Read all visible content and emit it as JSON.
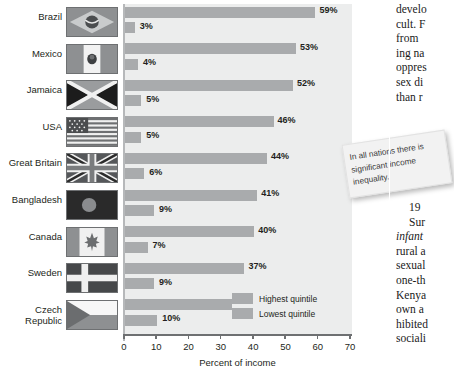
{
  "chart_data": {
    "type": "bar",
    "orientation": "horizontal",
    "title": "",
    "xlabel": "Percent of income",
    "ylabel": "",
    "xlim": [
      0,
      70
    ],
    "xticks": [
      0,
      10,
      20,
      30,
      40,
      50,
      60,
      70
    ],
    "grid": false,
    "legend_position": "inside-bottom-right",
    "categories": [
      "Brazil",
      "Mexico",
      "Jamaica",
      "USA",
      "Great Britain",
      "Bangladesh",
      "Canada",
      "Sweden",
      "Czech Republic"
    ],
    "series": [
      {
        "name": "Highest quintile",
        "color": "#a9abad",
        "values": [
          59,
          53,
          52,
          46,
          44,
          41,
          40,
          37,
          36
        ],
        "labels": [
          "59%",
          "53%",
          "52%",
          "46%",
          "44%",
          "41%",
          "40%",
          "37%",
          "36%"
        ]
      },
      {
        "name": "Lowest quintile",
        "color": "#a9abad",
        "values": [
          3,
          4,
          5,
          5,
          6,
          9,
          7,
          9,
          10
        ],
        "labels": [
          "3%",
          "4%",
          "5%",
          "5%",
          "6%",
          "9%",
          "7%",
          "9%",
          "10%"
        ]
      }
    ]
  },
  "chart": {
    "axis_title": "Percent of income",
    "tick_labels": [
      "0",
      "10",
      "20",
      "30",
      "40",
      "50",
      "60",
      "70"
    ],
    "rows": [
      {
        "country": "Brazil",
        "flag": "flag-brazil",
        "high": "59%",
        "low": "3%"
      },
      {
        "country": "Mexico",
        "flag": "flag-mexico",
        "high": "53%",
        "low": "4%"
      },
      {
        "country": "Jamaica",
        "flag": "flag-jamaica",
        "high": "52%",
        "low": "5%"
      },
      {
        "country": "USA",
        "flag": "flag-usa",
        "high": "46%",
        "low": "5%"
      },
      {
        "country": "Great Britain",
        "flag": "flag-great-britain",
        "high": "44%",
        "low": "6%"
      },
      {
        "country": "Bangladesh",
        "flag": "flag-bangladesh",
        "high": "41%",
        "low": "9%"
      },
      {
        "country": "Canada",
        "flag": "flag-canada",
        "high": "40%",
        "low": "7%"
      },
      {
        "country": "Sweden",
        "flag": "flag-sweden",
        "high": "37%",
        "low": "9%"
      },
      {
        "country": "Czech Republic",
        "flag": "flag-czech-republic",
        "high": "36%",
        "low": "10%"
      }
    ],
    "legend": [
      {
        "label": "Highest quintile",
        "color": "#a9abad"
      },
      {
        "label": "Lowest quintile",
        "color": "#a9abad"
      }
    ]
  },
  "callout": {
    "text": "In all nations there is significant income inequality."
  },
  "body_text": {
    "top_lines": [
      "develo",
      "cult. F",
      "from",
      "ing na",
      "oppres",
      "sex di",
      "than r"
    ],
    "bottom_lines": [
      "19",
      "Sur",
      "infant",
      "rural a",
      "sexual",
      "one-th",
      "Kenya",
      "own a",
      "hibited",
      "sociali"
    ]
  },
  "colors": {
    "bar": "#a9abad",
    "plot_background": "#eceded",
    "axis": "#6e7072",
    "text": "#231f20"
  }
}
